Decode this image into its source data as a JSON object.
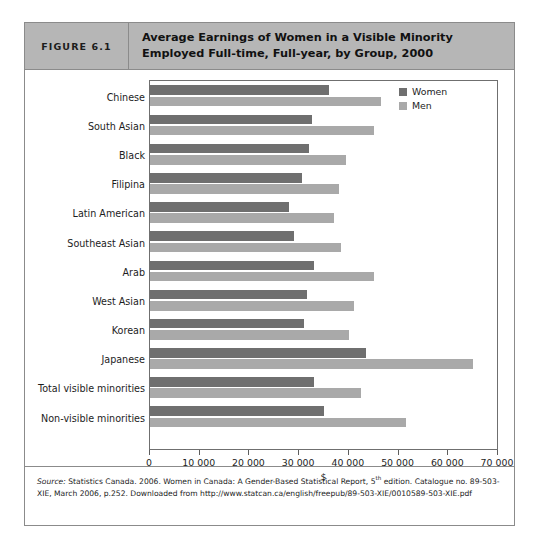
{
  "figure": {
    "number_label": "FIGURE 6.1",
    "title": "Average Earnings of Women in a Visible Minority Employed Full-time, Full-year, by Group, 2000"
  },
  "legend": {
    "women_label": "Women",
    "men_label": "Men",
    "women_color": "#6f6f6f",
    "men_color": "#a9a9a9"
  },
  "axis": {
    "x_title": "$",
    "ticks": [
      "0",
      "10 000",
      "20 000",
      "30 000",
      "40 000",
      "50 000",
      "60 000",
      "70 000"
    ]
  },
  "source": {
    "prefix": "Source:",
    "text_part1": " Statistics Canada. 2006. Women in Canada: A Gender-Based Statistical Report, 5",
    "superscript": "th",
    "text_part2": " edition. Catalogue no. 89-503-XIE, March 2006, p.252. Downloaded from http://www.statcan.ca/english/freepub/89-503-XIE/0010589-503-XIE.pdf"
  },
  "chart_data": {
    "type": "bar",
    "orientation": "horizontal",
    "title": "Average Earnings of Women in a Visible Minority Employed Full-time, Full-year, by Group, 2000",
    "xlabel": "$",
    "ylabel": "",
    "xlim": [
      0,
      70000
    ],
    "xticks": [
      0,
      10000,
      20000,
      30000,
      40000,
      50000,
      60000,
      70000
    ],
    "grid": false,
    "legend_position": "top-right",
    "categories": [
      "Chinese",
      "South Asian",
      "Black",
      "Filipina",
      "Latin American",
      "Southeast Asian",
      "Arab",
      "West Asian",
      "Korean",
      "Japanese",
      "Total visible minorities",
      "Non-visible minorities"
    ],
    "series": [
      {
        "name": "Women",
        "color": "#6f6f6f",
        "values": [
          36000,
          32500,
          32000,
          30500,
          28000,
          29000,
          33000,
          31500,
          31000,
          43500,
          33000,
          35000
        ]
      },
      {
        "name": "Men",
        "color": "#a9a9a9",
        "values": [
          46500,
          45000,
          39500,
          38000,
          37000,
          38500,
          45000,
          41000,
          40000,
          65000,
          42500,
          51500
        ]
      }
    ]
  }
}
